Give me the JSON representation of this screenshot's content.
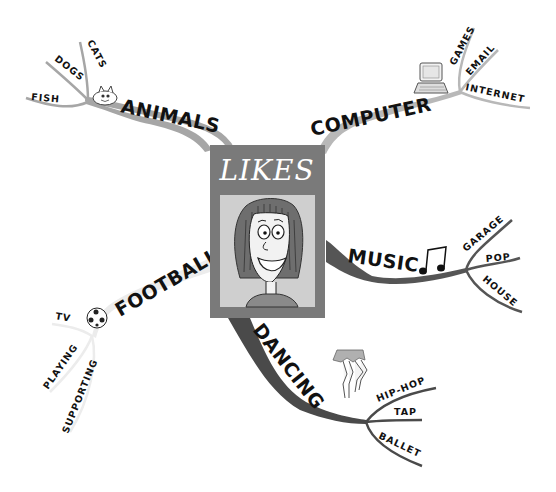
{
  "diagram": {
    "type": "mind-map",
    "center": {
      "title": "LIKES",
      "image": "smiling-girl-portrait"
    },
    "branches": [
      {
        "label": "ANIMALS",
        "icon": "cat-icon",
        "color": "#a6a6a6",
        "children": [
          {
            "label": "FISH"
          },
          {
            "label": "DOGS"
          },
          {
            "label": "CATS"
          }
        ]
      },
      {
        "label": "COMPUTER",
        "icon": "laptop-icon",
        "color": "#b8b8b8",
        "children": [
          {
            "label": "GAMES"
          },
          {
            "label": "EMAIL"
          },
          {
            "label": "INTERNET"
          }
        ]
      },
      {
        "label": "MUSIC",
        "icon": "music-notes-icon",
        "color": "#555555",
        "children": [
          {
            "label": "GARAGE"
          },
          {
            "label": "POP"
          },
          {
            "label": "HOUSE"
          }
        ]
      },
      {
        "label": "FOOTBALL",
        "icon": "football-icon",
        "color": "#ececec",
        "children": [
          {
            "label": "TV"
          },
          {
            "label": "PLAYING"
          },
          {
            "label": "SUPPORTING"
          }
        ]
      },
      {
        "label": "DANCING",
        "icon": "dancer-legs-icon",
        "color": "#4a4a4a",
        "children": [
          {
            "label": "HIP-HOP"
          },
          {
            "label": "TAP"
          },
          {
            "label": "BALLET"
          }
        ]
      }
    ]
  },
  "colors": {
    "card_frame": "#7a7a7a",
    "card_inner": "#cfcfcf",
    "hair": "#6e6e6e",
    "text": "#111111",
    "background": "#ffffff"
  }
}
